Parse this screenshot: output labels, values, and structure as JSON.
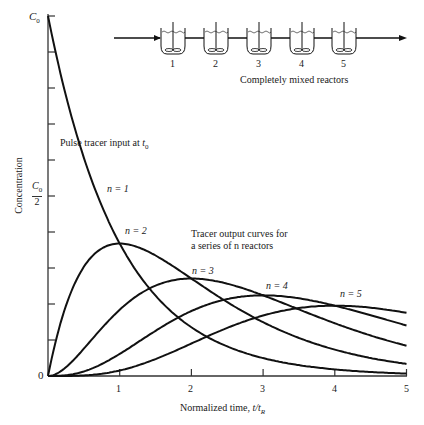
{
  "chart_data": {
    "type": "line",
    "title": "",
    "xlabel": "Normalized time, t/t_R",
    "ylabel": "Concentration",
    "xlim": [
      0,
      5
    ],
    "ylim": [
      0,
      1
    ],
    "x_ticks": [
      "0",
      "1",
      "2",
      "3",
      "4",
      "5"
    ],
    "y_tick_labels": [
      {
        "value": 0,
        "label": "0"
      },
      {
        "value": 0.5,
        "label": "C0/2"
      },
      {
        "value": 1.0,
        "label": "C0"
      }
    ],
    "y_minor_ticks": [
      0.1,
      0.2,
      0.3,
      0.4,
      0.5,
      0.6,
      0.7,
      0.8,
      0.9,
      1.0
    ],
    "grid": false,
    "legend": "none (inline curve labels)",
    "formula": "C/C0 = (t/tR)^(n-1) * exp(-t/tR) / (n-1)!",
    "x": [
      0,
      0.5,
      1,
      1.5,
      2,
      2.5,
      3,
      3.5,
      4,
      4.5,
      5
    ],
    "series": [
      {
        "name": "n = 1",
        "values": [
          1.0,
          0.607,
          0.368,
          0.223,
          0.135,
          0.082,
          0.05,
          0.03,
          0.018,
          0.011,
          0.007
        ]
      },
      {
        "name": "n = 2",
        "values": [
          0.0,
          0.303,
          0.368,
          0.335,
          0.271,
          0.205,
          0.149,
          0.106,
          0.073,
          0.05,
          0.034
        ]
      },
      {
        "name": "n = 3",
        "values": [
          0.0,
          0.076,
          0.184,
          0.251,
          0.271,
          0.257,
          0.224,
          0.185,
          0.147,
          0.112,
          0.084
        ]
      },
      {
        "name": "n = 4",
        "values": [
          0.0,
          0.013,
          0.061,
          0.126,
          0.18,
          0.214,
          0.224,
          0.216,
          0.195,
          0.169,
          0.14
        ]
      },
      {
        "name": "n = 5",
        "values": [
          0.0,
          0.002,
          0.015,
          0.047,
          0.09,
          0.134,
          0.168,
          0.189,
          0.195,
          0.19,
          0.175
        ]
      }
    ],
    "annotations": [
      "Pulse tracer input at t0",
      "Tracer output curves for a series of n reactors",
      "Completely mixed reactors"
    ]
  },
  "labels": {
    "y_top": "C",
    "y_top_sub": "0",
    "y_half_num": "C",
    "y_half_sub": "0",
    "y_half_den": "2",
    "y_zero": "0",
    "y_axis": "Concentration",
    "x_axis": "Normalized time, ",
    "x_axis_var": "t/t",
    "x_axis_sub": "R",
    "pulse": "Pulse tracer input at ",
    "pulse_var": "t",
    "pulse_sub": "0",
    "tracer_line1": "Tracer output curves for",
    "tracer_line2": "a series of n reactors",
    "n1": "n = 1",
    "n2": "n = 2",
    "n3": "n = 3",
    "n4": "n = 4",
    "n5": "n = 5",
    "reactors_caption": "Completely mixed reactors",
    "reactor_numbers": [
      "1",
      "2",
      "3",
      "4",
      "5"
    ],
    "x_ticks": [
      "1",
      "2",
      "3",
      "4",
      "5"
    ]
  }
}
